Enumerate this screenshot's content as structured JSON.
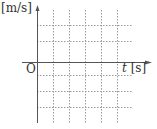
{
  "diagram": {
    "type": "blank velocity-time graph grid",
    "y_axis_label": "[m/s]",
    "x_axis_var": "t",
    "x_axis_unit": "[s]",
    "origin_label": "O",
    "grid": {
      "style": "dashed",
      "vertical_lines_right_of_y_axis": 5,
      "horizontal_lines_above_x_axis": 2,
      "horizontal_lines_below_x_axis": 3
    },
    "colors": {
      "axis": "#555555",
      "grid": "#9a9a9a",
      "text": "#333333"
    }
  }
}
